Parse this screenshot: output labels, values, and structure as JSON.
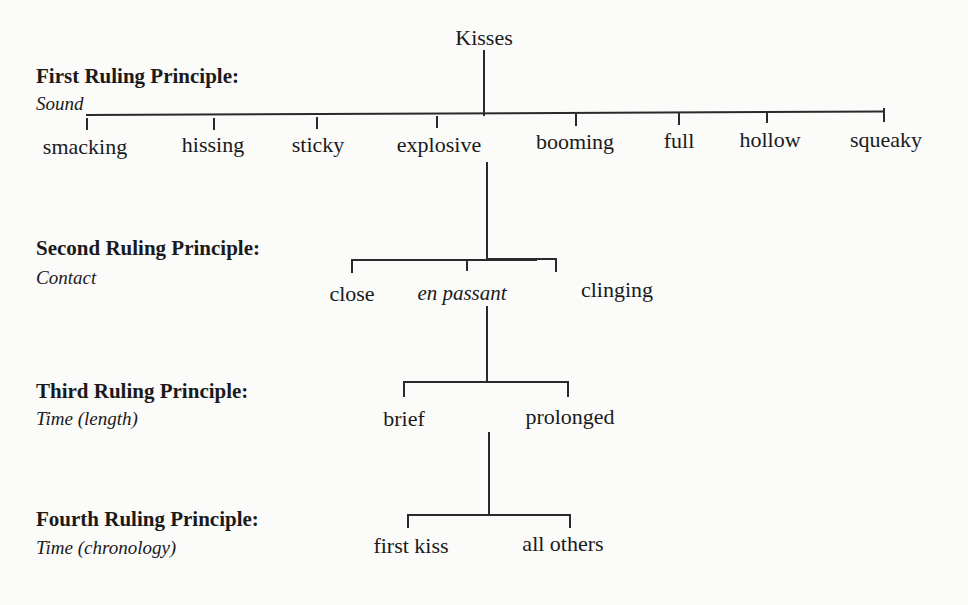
{
  "root": {
    "label": "Kisses"
  },
  "principles": [
    {
      "title": "First Ruling Principle:",
      "criterion": "Sound"
    },
    {
      "title": "Second Ruling Principle:",
      "criterion": "Contact"
    },
    {
      "title": "Third Ruling Principle:",
      "criterion": "Time (length)"
    },
    {
      "title": "Fourth Ruling Principle:",
      "criterion": "Time (chronology)"
    }
  ],
  "levels": {
    "sound": [
      "smacking",
      "hissing",
      "sticky",
      "explosive",
      "booming",
      "full",
      "hollow",
      "squeaky"
    ],
    "contact": [
      "close",
      "en passant",
      "clinging"
    ],
    "time_length": [
      "brief",
      "prolonged"
    ],
    "time_chronology": [
      "first kiss",
      "all others"
    ]
  },
  "tree": {
    "expanded_path": [
      "Kisses",
      "explosive",
      "en passant",
      "prolonged"
    ]
  },
  "colors": {
    "ink": "#1a1a1a",
    "paper": "#fbfbfa"
  }
}
